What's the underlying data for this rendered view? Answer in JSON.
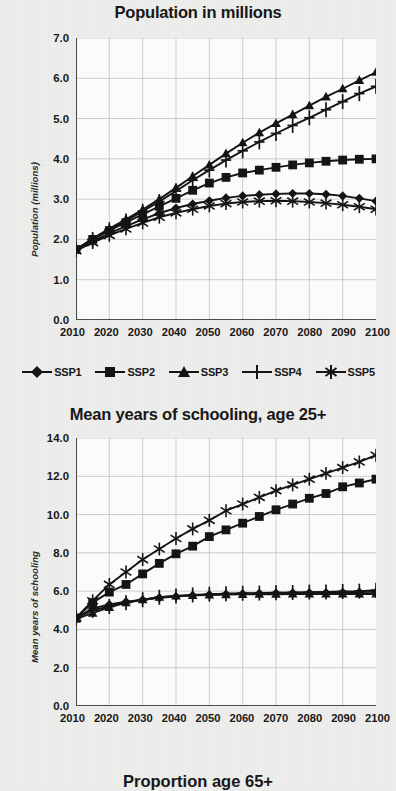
{
  "page": {
    "background_color": "#eeeeec",
    "ink_color": "#111111"
  },
  "series_names": [
    "SSP1",
    "SSP2",
    "SSP3",
    "SSP4",
    "SSP5"
  ],
  "legend": {
    "items": [
      {
        "label": "SSP1",
        "marker": "diamond-marker"
      },
      {
        "label": "SSP2",
        "marker": "square-marker"
      },
      {
        "label": "SSP3",
        "marker": "triangle-marker"
      },
      {
        "label": "SSP4",
        "marker": "plus-marker"
      },
      {
        "label": "SSP5",
        "marker": "asterisk-marker"
      }
    ]
  },
  "chart_data": [
    {
      "type": "line",
      "id": "population-chart",
      "title": "Population in millions",
      "xlabel": "",
      "ylabel": "Population (millions)",
      "x": [
        2010,
        2015,
        2020,
        2025,
        2030,
        2035,
        2040,
        2045,
        2050,
        2055,
        2060,
        2065,
        2070,
        2075,
        2080,
        2085,
        2090,
        2095,
        2100
      ],
      "xtick_labels": [
        "2010",
        "2020",
        "2030",
        "2040",
        "2050",
        "2060",
        "2070",
        "2080",
        "2090",
        "2100"
      ],
      "xlim": [
        2010,
        2100
      ],
      "ylim": [
        0.0,
        7.0
      ],
      "ytick_labels": [
        "0.0",
        "1.0",
        "2.0",
        "3.0",
        "4.0",
        "5.0",
        "6.0",
        "7.0"
      ],
      "yticks": [
        0.0,
        1.0,
        2.0,
        3.0,
        4.0,
        5.0,
        6.0,
        7.0
      ],
      "grid": true,
      "legend_position": "below",
      "series": [
        {
          "name": "SSP1",
          "marker": "diamond-marker",
          "values": [
            1.75,
            1.95,
            2.15,
            2.33,
            2.5,
            2.65,
            2.78,
            2.88,
            2.96,
            3.03,
            3.08,
            3.11,
            3.13,
            3.14,
            3.14,
            3.12,
            3.08,
            3.02,
            2.95
          ]
        },
        {
          "name": "SSP2",
          "marker": "square-marker",
          "values": [
            1.75,
            2.0,
            2.22,
            2.42,
            2.62,
            2.82,
            3.02,
            3.22,
            3.4,
            3.54,
            3.65,
            3.72,
            3.79,
            3.85,
            3.9,
            3.94,
            3.97,
            3.99,
            4.0
          ]
        },
        {
          "name": "SSP3",
          "marker": "triangle-marker",
          "values": [
            1.75,
            2.02,
            2.27,
            2.5,
            2.74,
            3.0,
            3.28,
            3.57,
            3.85,
            4.13,
            4.4,
            4.65,
            4.88,
            5.1,
            5.32,
            5.54,
            5.74,
            5.95,
            6.15
          ]
        },
        {
          "name": "SSP4",
          "marker": "plus-marker",
          "values": [
            1.75,
            2.0,
            2.24,
            2.46,
            2.7,
            2.94,
            3.2,
            3.47,
            3.72,
            3.97,
            4.2,
            4.42,
            4.63,
            4.83,
            5.02,
            5.22,
            5.42,
            5.62,
            5.8
          ]
        },
        {
          "name": "SSP5",
          "marker": "asterisk-marker",
          "values": [
            1.72,
            1.92,
            2.1,
            2.26,
            2.41,
            2.55,
            2.66,
            2.75,
            2.83,
            2.89,
            2.93,
            2.95,
            2.96,
            2.95,
            2.93,
            2.9,
            2.86,
            2.81,
            2.75
          ]
        }
      ]
    },
    {
      "type": "line",
      "id": "schooling-chart",
      "title": "Mean years of schooling, age 25+",
      "xlabel": "",
      "ylabel": "Mean years of schooling",
      "x": [
        2010,
        2015,
        2020,
        2025,
        2030,
        2035,
        2040,
        2045,
        2050,
        2055,
        2060,
        2065,
        2070,
        2075,
        2080,
        2085,
        2090,
        2095,
        2100
      ],
      "xtick_labels": [
        "2010",
        "2020",
        "2030",
        "2040",
        "2050",
        "2060",
        "2070",
        "2080",
        "2090",
        "2100"
      ],
      "xlim": [
        2010,
        2100
      ],
      "ylim": [
        0.0,
        14.0
      ],
      "ytick_labels": [
        "0.0",
        "2.0",
        "4.0",
        "6.0",
        "8.0",
        "10.0",
        "12.0",
        "14.0"
      ],
      "yticks": [
        0.0,
        2.0,
        4.0,
        6.0,
        8.0,
        10.0,
        12.0,
        14.0
      ],
      "grid": true,
      "legend_position": "none",
      "series": [
        {
          "name": "SSP1",
          "marker": "diamond-marker",
          "values": [
            4.6,
            5.1,
            5.3,
            5.45,
            5.55,
            5.65,
            5.72,
            5.78,
            5.82,
            5.85,
            5.87,
            5.89,
            5.9,
            5.91,
            5.92,
            5.93,
            5.94,
            5.95,
            5.96
          ]
        },
        {
          "name": "SSP2",
          "marker": "square-marker",
          "values": [
            4.6,
            5.4,
            5.95,
            6.35,
            6.9,
            7.45,
            7.95,
            8.35,
            8.85,
            9.2,
            9.55,
            9.9,
            10.25,
            10.55,
            10.85,
            11.1,
            11.45,
            11.65,
            11.85
          ]
        },
        {
          "name": "SSP3",
          "marker": "triangle-marker",
          "values": [
            4.55,
            4.85,
            5.15,
            5.4,
            5.55,
            5.68,
            5.75,
            5.78,
            5.8,
            5.82,
            5.83,
            5.84,
            5.84,
            5.85,
            5.85,
            5.85,
            5.85,
            5.85,
            5.85
          ]
        },
        {
          "name": "SSP4",
          "marker": "plus-marker",
          "values": [
            4.6,
            5.0,
            5.2,
            5.4,
            5.55,
            5.68,
            5.75,
            5.8,
            5.84,
            5.87,
            5.89,
            5.9,
            5.92,
            5.93,
            5.95,
            5.96,
            5.98,
            6.0,
            6.05
          ]
        },
        {
          "name": "SSP5",
          "marker": "asterisk-marker",
          "values": [
            4.6,
            5.5,
            6.35,
            7.0,
            7.65,
            8.2,
            8.75,
            9.25,
            9.7,
            10.2,
            10.55,
            10.9,
            11.25,
            11.55,
            11.85,
            12.15,
            12.45,
            12.75,
            13.1
          ]
        }
      ]
    }
  ],
  "clipped_next_chart": {
    "title": "Proportion age 65+"
  }
}
